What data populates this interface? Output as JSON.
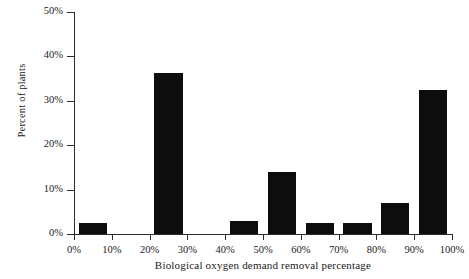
{
  "chart_data": {
    "type": "bar",
    "title": "",
    "subtitle": "",
    "xlabel": "Biological oxygen demand removal percentage",
    "ylabel": "Percent of plants",
    "categories": [
      "0%",
      "10%",
      "20%",
      "30%",
      "40%",
      "50%",
      "60%",
      "70%",
      "80%",
      "90%",
      "100%"
    ],
    "values": [
      2.5,
      0,
      36.3,
      0,
      3,
      14,
      2.5,
      2.5,
      7,
      32.5,
      0
    ],
    "xlim": [
      0,
      100
    ],
    "ylim": [
      0,
      50
    ],
    "ytick_labels": [
      "0%",
      "10%",
      "20%",
      "30%",
      "40%",
      "50%"
    ],
    "ytick_values": [
      0,
      10,
      20,
      30,
      40,
      50
    ],
    "xtick_labels": [
      "0%",
      "10%",
      "20%",
      "30%",
      "40%",
      "50%",
      "60%",
      "70%",
      "80%",
      "90%",
      "100%"
    ],
    "xtick_values": [
      0,
      10,
      20,
      30,
      40,
      50,
      60,
      70,
      80,
      90,
      100
    ],
    "grid": false,
    "legend": false,
    "legend_position": "none",
    "bar_color": "#0d0d0d",
    "axis_color": "#2b2b2b",
    "background_color": "#ffffff",
    "bar_alignment": "binned-between-ticks",
    "annotations": []
  },
  "artifacts": {
    "top_clipped_text": ""
  }
}
